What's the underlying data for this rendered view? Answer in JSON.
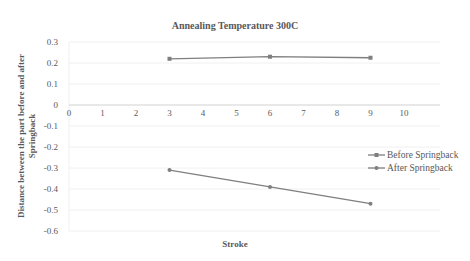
{
  "chart_data": {
    "type": "line",
    "title": "Annealing Temperature 300C",
    "xlabel": "Stroke",
    "ylabel": "Distance between the part before and after Springback",
    "xlim": [
      0,
      10
    ],
    "ylim": [
      -0.6,
      0.3
    ],
    "x_ticks": [
      "0",
      "1",
      "2",
      "3",
      "4",
      "5",
      "6",
      "7",
      "8",
      "9",
      "10"
    ],
    "y_ticks": [
      "0.3",
      "0.2",
      "0.1",
      "0",
      "-0.1",
      "-0.2",
      "-0.3",
      "-0.4",
      "-0.5",
      "-0.6"
    ],
    "grid": true,
    "legend_position": "right",
    "x": [
      3,
      6,
      9
    ],
    "series": [
      {
        "name": "Before Springback",
        "values": [
          0.22,
          0.23,
          0.225
        ],
        "color": "#7f7f7f",
        "marker": "square"
      },
      {
        "name": "After Springback",
        "values": [
          -0.31,
          -0.39,
          -0.47
        ],
        "color": "#7f7f7f",
        "marker": "circle"
      }
    ]
  }
}
